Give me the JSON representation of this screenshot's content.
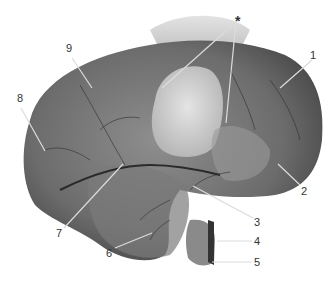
{
  "figure": {
    "labels": [
      {
        "id": "star",
        "text": "*",
        "x": 239,
        "y": 16
      },
      {
        "id": "1",
        "text": "1",
        "x": 311,
        "y": 52
      },
      {
        "id": "2",
        "text": "2",
        "x": 301,
        "y": 186
      },
      {
        "id": "3",
        "text": "3",
        "x": 254,
        "y": 217
      },
      {
        "id": "4",
        "text": "4",
        "x": 254,
        "y": 238
      },
      {
        "id": "5",
        "text": "5",
        "x": 254,
        "y": 259
      },
      {
        "id": "6",
        "text": "6",
        "x": 106,
        "y": 250
      },
      {
        "id": "7",
        "text": "7",
        "x": 56,
        "y": 229
      },
      {
        "id": "8",
        "text": "8",
        "x": 17,
        "y": 95
      },
      {
        "id": "9",
        "text": "9",
        "x": 65,
        "y": 45
      }
    ]
  }
}
